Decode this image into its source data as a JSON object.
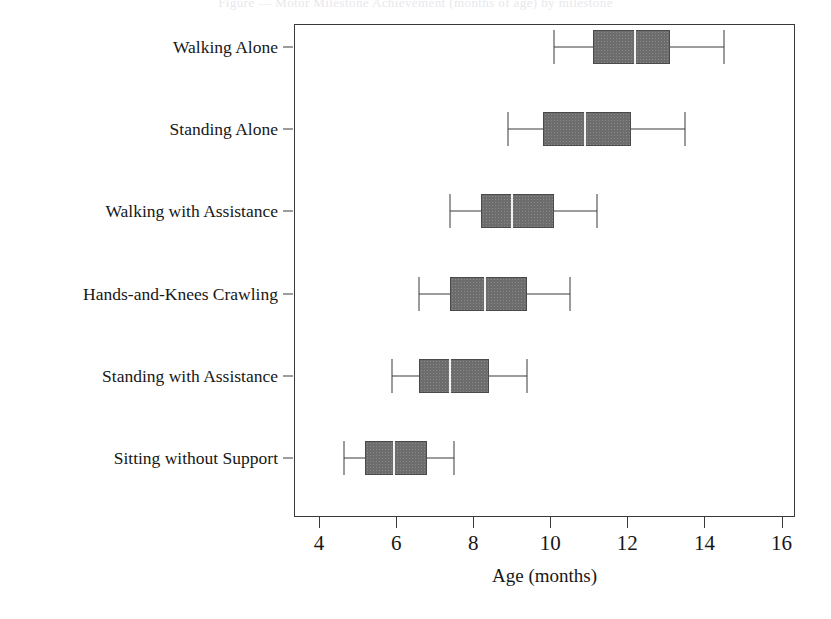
{
  "title_strip": {
    "text": "Figure  —  Motor Milestone Achievement (months of age)  by milestone"
  },
  "chart_data": {
    "type": "boxplot",
    "title": "",
    "xlabel": "Age (months)",
    "ylabel": "",
    "xlim": [
      3.35,
      16.35
    ],
    "xticks": [
      4,
      6,
      8,
      10,
      12,
      14,
      16
    ],
    "xtick_labels": [
      "4",
      "6",
      "8",
      "10",
      "12",
      "14",
      "16"
    ],
    "grid": false,
    "legend": "none",
    "orientation": "horizontal",
    "box_fill_color": "#6d6d6d",
    "box_edge_color": "#4a4a4a",
    "median_color": "#f2f2f2",
    "whisker_color": "#3a3a3a",
    "categories": [
      "Walking Alone",
      "Standing Alone",
      "Walking with Assistance",
      "Hands-and-Knees Crawling",
      "Standing with Assistance",
      "Sitting without Support"
    ],
    "boxes": [
      {
        "category": "Walking Alone",
        "whisker_low": 10.1,
        "q1": 11.1,
        "median": 12.2,
        "q3": 13.1,
        "whisker_high": 14.5
      },
      {
        "category": "Standing Alone",
        "whisker_low": 8.9,
        "q1": 9.8,
        "median": 10.9,
        "q3": 12.1,
        "whisker_high": 13.5
      },
      {
        "category": "Walking with Assistance",
        "whisker_low": 7.4,
        "q1": 8.2,
        "median": 9.0,
        "q3": 10.1,
        "whisker_high": 11.2
      },
      {
        "category": "Hands-and-Knees Crawling",
        "whisker_low": 6.6,
        "q1": 7.4,
        "median": 8.3,
        "q3": 9.4,
        "whisker_high": 10.5
      },
      {
        "category": "Standing with Assistance",
        "whisker_low": 5.9,
        "q1": 6.6,
        "median": 7.4,
        "q3": 8.4,
        "whisker_high": 9.4
      },
      {
        "category": "Sitting without Support",
        "whisker_low": 4.65,
        "q1": 5.2,
        "median": 5.95,
        "q3": 6.8,
        "whisker_high": 7.5
      }
    ]
  }
}
